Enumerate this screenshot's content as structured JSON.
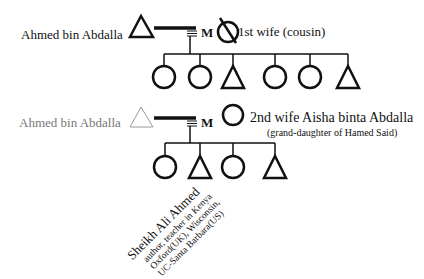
{
  "diagram": {
    "type": "genealogy-kinship-chart",
    "generation1": {
      "husband_label": "Ahmed bin Abdalla",
      "marriage_marker": "M",
      "wife_label": "1st wife (cousin)",
      "wife_status": "deceased",
      "children": [
        "female",
        "female",
        "male",
        "female",
        "female",
        "male"
      ]
    },
    "generation2": {
      "husband_label": "Ahmed bin Abdalla",
      "marriage_marker": "M",
      "wife_label": "2nd wife Aisha binta Abdalla",
      "wife_note": "(grand-daughter of Hamed Said)",
      "children": [
        "female",
        "male",
        "female",
        "male"
      ]
    },
    "annotated_child": {
      "name": "Sheikh Ali Ahmed",
      "line1": "author, teacher in Kenya",
      "line2": "Oxford(UK), Wisconsin,",
      "line3": "UC-Santa Barbara(US)"
    },
    "legend_shapes": {
      "male": "triangle",
      "female": "circle",
      "deceased": "crossed-circle"
    }
  }
}
